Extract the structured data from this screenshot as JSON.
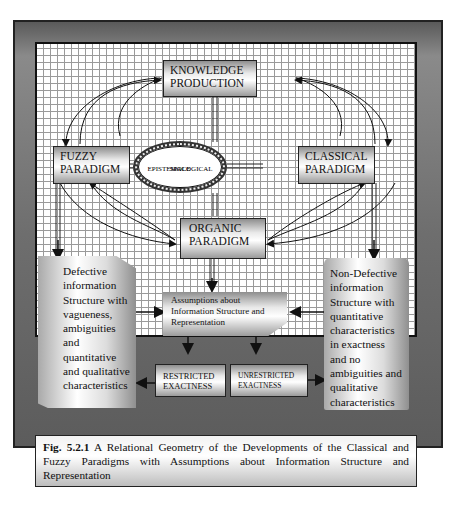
{
  "diagram": {
    "nodes": {
      "knowledge_production": "KNOWLEDGE PRODUCTION",
      "knowledge_line1": "KNOWLEDGE",
      "knowledge_line2": "PRODUCTION",
      "fuzzy_line1": "FUZZY",
      "fuzzy_line2": "PARADIGM",
      "classical_line1": "CLASSICAL",
      "classical_line2": "PARADIGM",
      "organic_line1": "ORGANIC",
      "organic_line2": "PARADIGM",
      "epistemic_line1": "EPISTEMOLOGICAL",
      "epistemic_line2": "SPACE",
      "assumptions": "Assumptions about Information Structure and Representation",
      "restricted_line1": "RESTRICTED",
      "restricted_line2": "EXACTNESS",
      "unrestricted_line1": "UNRESTRICTED",
      "unrestricted_line2": "EXACTNESS",
      "defective": "Defective information Structure with vagueness, ambiguities and quantitative and qualitative characteristics",
      "non_defective": "Non-Defective information Structure with quantitative characteristics in exactness and no ambiguities and qualitative characteristics"
    },
    "caption": {
      "label": "Fig. 5.2.1",
      "text": " A Relational Geometry of the Developments of the Classical and Fuzzy Paradigms with Assumptions about Information Structure and Representation"
    },
    "colors": {
      "frame": "#6e6e6e",
      "grid_line": "#9a9a9a",
      "box_dark": "#8e8e8e",
      "box_light": "#ffffff",
      "arrow": "#111111"
    }
  }
}
